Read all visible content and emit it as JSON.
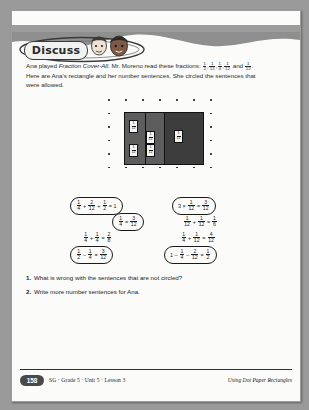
{
  "banner": {
    "label": "Discuss",
    "icon_left": "boy-face-icon",
    "icon_right": "girl-face-icon"
  },
  "intro": {
    "line1_a": "Ana played ",
    "line1_italic": "Fraction Cover-All",
    "line1_b": ". Mr. Moreno read these fractions: ",
    "line1_fractions": [
      {
        "n": "1",
        "d": "2"
      },
      {
        "n": "1",
        "d": "12"
      },
      {
        "n": "1",
        "d": "4"
      },
      {
        "n": "1",
        "d": "12"
      },
      {
        "n": "1",
        "d": "12"
      }
    ],
    "line1_and": " and ",
    "line1_end": ".",
    "line2": "Here are Ana's rectangle and her number sentences. She circled the sentences that",
    "line3": "were allowed."
  },
  "diagram": {
    "name": "dot-paper-rectangle",
    "dot_cols": 7,
    "dot_rows": 6,
    "rect_label": "Ana's rectangle shaded on dot paper",
    "cells": [
      {
        "n": "1",
        "d": "12"
      },
      {
        "n": "1",
        "d": "12"
      },
      {
        "n": "1",
        "d": "12"
      },
      {
        "n": "1",
        "d": "12"
      },
      {
        "n": "1",
        "d": "12"
      }
    ]
  },
  "sentences": {
    "left": [
      {
        "id": "eq-l1",
        "circled": true,
        "parts": [
          {
            "t": "frac",
            "n": "1",
            "d": "4"
          },
          {
            "t": "op",
            "v": " + "
          },
          {
            "t": "frac",
            "n": "2",
            "d": "12"
          },
          {
            "t": "op",
            "v": " + "
          },
          {
            "t": "frac",
            "n": "1",
            "d": "2"
          },
          {
            "t": "op",
            "v": " = "
          },
          {
            "t": "txt",
            "v": "1"
          }
        ]
      },
      {
        "id": "eq-l2",
        "circled": true,
        "parts": [
          {
            "t": "frac",
            "n": "1",
            "d": "4"
          },
          {
            "t": "op",
            "v": " = "
          },
          {
            "t": "frac",
            "n": "3",
            "d": "12"
          }
        ]
      },
      {
        "id": "eq-l3",
        "circled": false,
        "parts": [
          {
            "t": "frac",
            "n": "1",
            "d": "4"
          },
          {
            "t": "op",
            "v": " + "
          },
          {
            "t": "frac",
            "n": "1",
            "d": "4"
          },
          {
            "t": "op",
            "v": " = "
          },
          {
            "t": "frac",
            "n": "2",
            "d": "8"
          }
        ]
      },
      {
        "id": "eq-l4",
        "circled": true,
        "parts": [
          {
            "t": "frac",
            "n": "1",
            "d": "2"
          },
          {
            "t": "op",
            "v": " − "
          },
          {
            "t": "frac",
            "n": "1",
            "d": "4"
          },
          {
            "t": "op",
            "v": " = "
          },
          {
            "t": "frac",
            "n": "3",
            "d": "12"
          }
        ]
      }
    ],
    "right": [
      {
        "id": "eq-r1",
        "circled": true,
        "parts": [
          {
            "t": "txt",
            "v": "3"
          },
          {
            "t": "op",
            "v": " × "
          },
          {
            "t": "frac",
            "n": "1",
            "d": "12"
          },
          {
            "t": "op",
            "v": " = "
          },
          {
            "t": "frac",
            "n": "3",
            "d": "12"
          }
        ]
      },
      {
        "id": "eq-r2",
        "circled": false,
        "parts": [
          {
            "t": "frac",
            "n": "1",
            "d": "12"
          },
          {
            "t": "op",
            "v": " + "
          },
          {
            "t": "frac",
            "n": "1",
            "d": "12"
          },
          {
            "t": "op",
            "v": " = "
          },
          {
            "t": "frac",
            "n": "1",
            "d": "6"
          }
        ]
      },
      {
        "id": "eq-r3",
        "circled": false,
        "parts": [
          {
            "t": "frac",
            "n": "1",
            "d": "4"
          },
          {
            "t": "op",
            "v": " + "
          },
          {
            "t": "frac",
            "n": "1",
            "d": "12"
          },
          {
            "t": "op",
            "v": " = "
          },
          {
            "t": "frac",
            "n": "4",
            "d": "12"
          }
        ]
      },
      {
        "id": "eq-r4",
        "circled": true,
        "parts": [
          {
            "t": "txt",
            "v": "1"
          },
          {
            "t": "op",
            "v": " − "
          },
          {
            "t": "frac",
            "n": "1",
            "d": "4"
          },
          {
            "t": "op",
            "v": " − "
          },
          {
            "t": "frac",
            "n": "2",
            "d": "12"
          },
          {
            "t": "op",
            "v": " = "
          },
          {
            "t": "frac",
            "n": "1",
            "d": "2"
          }
        ]
      }
    ]
  },
  "questions": [
    {
      "num": "1.",
      "text": "What is wrong with the sentences that are not circled?"
    },
    {
      "num": "2.",
      "text": "Write more number sentences for Ana."
    }
  ],
  "footer": {
    "page_number": "158",
    "left": "SG · Grade 5 · Unit 5 · Lesson 3",
    "right": "Using Dot Paper Rectangles"
  }
}
